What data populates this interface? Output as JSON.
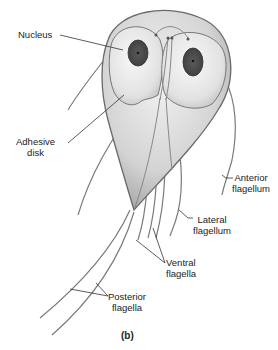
{
  "figure": {
    "caption": "(b)",
    "colors": {
      "body_fill": "#d8d8d8",
      "body_outline": "#6a6a6a",
      "nucleus": "#555555",
      "flagella": "#777777",
      "leader": "#333333",
      "text": "#222222"
    },
    "labels": [
      {
        "id": "nucleus",
        "text": "Nucleus"
      },
      {
        "id": "adhesive-disk",
        "line1": "Adhesive",
        "line2": "disk"
      },
      {
        "id": "anterior-flagellum",
        "line1": "Anterior",
        "line2": "flagellum"
      },
      {
        "id": "lateral-flagellum",
        "line1": "Lateral",
        "line2": "flagellum"
      },
      {
        "id": "ventral-flagella",
        "line1": "Ventral",
        "line2": "flagella"
      },
      {
        "id": "posterior-flagella",
        "line1": "Posterior",
        "line2": "flagella"
      }
    ]
  }
}
